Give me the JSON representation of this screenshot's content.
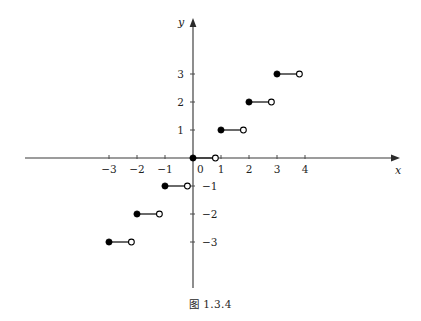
{
  "figure": {
    "caption": "图 1.3.4",
    "background_color": "#ffffff",
    "width": 421,
    "height": 321
  },
  "axes": {
    "x_label": "x",
    "y_label": "y",
    "x_label_name": "x-axis-label",
    "y_label_name": "y-axis-label",
    "axis_color": "#3a3a3a",
    "origin_px": {
      "x": 193,
      "y": 158
    },
    "unit_px": 28,
    "x_axis_start_px": 25,
    "x_axis_end_px": 400,
    "y_axis_top_px": 18,
    "y_axis_bottom_px": 288
  },
  "chart_data": {
    "type": "scatter",
    "title": "图 1.3.4",
    "xlabel": "x",
    "ylabel": "y",
    "grid": false,
    "legend": "none",
    "xlim": [
      -6,
      7.4
    ],
    "ylim": [
      -4.6,
      5
    ],
    "x_ticks": [
      {
        "value": -3,
        "label": "-3"
      },
      {
        "value": -2,
        "label": "-2"
      },
      {
        "value": -1,
        "label": "-1"
      },
      {
        "value": 0,
        "label": "0"
      },
      {
        "value": 1,
        "label": "1"
      },
      {
        "value": 2,
        "label": "2"
      },
      {
        "value": 3,
        "label": "3"
      },
      {
        "value": 4,
        "label": "4"
      }
    ],
    "y_ticks": [
      {
        "value": 3,
        "label": "3"
      },
      {
        "value": 2,
        "label": "2"
      },
      {
        "value": 1,
        "label": "1"
      },
      {
        "value": -1,
        "label": "-1"
      },
      {
        "value": -2,
        "label": "-2"
      },
      {
        "value": -3,
        "label": "-3"
      }
    ],
    "segments": [
      {
        "y": -3,
        "x_start": -3,
        "x_end": -2.2,
        "left_endpoint": "closed",
        "right_endpoint": "open"
      },
      {
        "y": -2,
        "x_start": -2,
        "x_end": -1.2,
        "left_endpoint": "closed",
        "right_endpoint": "open"
      },
      {
        "y": -1,
        "x_start": -1,
        "x_end": -0.2,
        "left_endpoint": "closed",
        "right_endpoint": "open"
      },
      {
        "y": 0,
        "x_start": 0,
        "x_end": 0.8,
        "left_endpoint": "closed",
        "right_endpoint": "open"
      },
      {
        "y": 1,
        "x_start": 1,
        "x_end": 1.8,
        "left_endpoint": "closed",
        "right_endpoint": "open"
      },
      {
        "y": 2,
        "x_start": 2,
        "x_end": 2.8,
        "left_endpoint": "closed",
        "right_endpoint": "open"
      },
      {
        "y": 3,
        "x_start": 3,
        "x_end": 3.8,
        "left_endpoint": "closed",
        "right_endpoint": "open"
      }
    ],
    "closed_points": [
      {
        "x": -3,
        "y": -3
      },
      {
        "x": -2,
        "y": -2
      },
      {
        "x": -1,
        "y": -1
      },
      {
        "x": 0,
        "y": 0
      },
      {
        "x": 1,
        "y": 1
      },
      {
        "x": 2,
        "y": 2
      },
      {
        "x": 3,
        "y": 3
      }
    ],
    "open_points": [
      {
        "x": -2.2,
        "y": -3
      },
      {
        "x": -1.2,
        "y": -2
      },
      {
        "x": -0.2,
        "y": -1
      },
      {
        "x": 0.8,
        "y": 0
      },
      {
        "x": 1.8,
        "y": 1
      },
      {
        "x": 2.8,
        "y": 2
      },
      {
        "x": 3.8,
        "y": 3
      }
    ]
  }
}
